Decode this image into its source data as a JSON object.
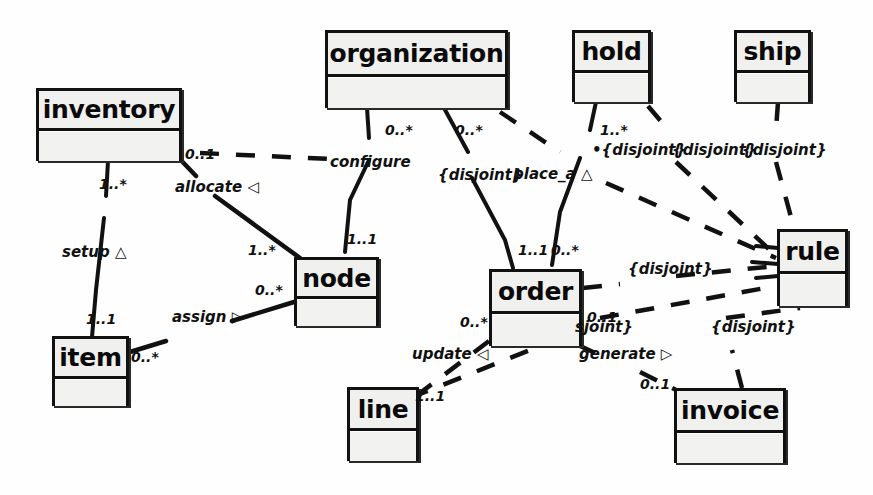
{
  "diagram": {
    "background_color": "#fefefe",
    "line_color": "#111111",
    "box_fill_color": "#f2f2f0"
  },
  "classes": [
    {
      "id": "inventory",
      "name": "inventory",
      "x": 36,
      "y": 88,
      "w": 146,
      "h": 73,
      "font_size": 25
    },
    {
      "id": "organization",
      "name": "organization",
      "x": 325,
      "y": 30,
      "w": 183,
      "h": 78,
      "font_size": 25
    },
    {
      "id": "hold",
      "name": "hold",
      "x": 572,
      "y": 30,
      "w": 79,
      "h": 72,
      "font_size": 25
    },
    {
      "id": "ship",
      "name": "ship",
      "x": 734,
      "y": 30,
      "w": 77,
      "h": 72,
      "font_size": 25
    },
    {
      "id": "node",
      "name": "node",
      "x": 294,
      "y": 257,
      "w": 85,
      "h": 69,
      "font_size": 25
    },
    {
      "id": "order",
      "name": "order",
      "x": 489,
      "y": 269,
      "w": 93,
      "h": 77,
      "font_size": 25
    },
    {
      "id": "rule",
      "name": "rule",
      "x": 777,
      "y": 229,
      "w": 71,
      "h": 77,
      "font_size": 25
    },
    {
      "id": "item",
      "name": "item",
      "x": 52,
      "y": 336,
      "w": 77,
      "h": 70,
      "font_size": 25
    },
    {
      "id": "line",
      "name": "line",
      "x": 347,
      "y": 387,
      "w": 72,
      "h": 74,
      "font_size": 25
    },
    {
      "id": "invoice",
      "name": "invoice",
      "x": 674,
      "y": 388,
      "w": 112,
      "h": 75,
      "font_size": 25
    }
  ],
  "labels": {
    "multiplicities": [
      {
        "id": "m-inv-alloc",
        "text": "0..1",
        "x": 185,
        "y": 147
      },
      {
        "id": "m-inv-setup",
        "text": "1..*",
        "x": 99,
        "y": 177
      },
      {
        "id": "m-item-setup",
        "text": "1..1",
        "x": 86,
        "y": 312
      },
      {
        "id": "m-item-assign",
        "text": "0..*",
        "x": 131,
        "y": 350
      },
      {
        "id": "m-node-alloc",
        "text": "1..*",
        "x": 248,
        "y": 243
      },
      {
        "id": "m-node-assign",
        "text": "0..*",
        "x": 255,
        "y": 283
      },
      {
        "id": "m-node-conf",
        "text": "1..1",
        "x": 347,
        "y": 232
      },
      {
        "id": "m-org-conf",
        "text": "0..*",
        "x": 385,
        "y": 123
      },
      {
        "id": "m-org-place",
        "text": "0..*",
        "x": 455,
        "y": 123
      },
      {
        "id": "m-hold-place",
        "text": "1..*",
        "x": 600,
        "y": 123
      },
      {
        "id": "m-order-place",
        "text": "1..1",
        "x": 518,
        "y": 243
      },
      {
        "id": "m-order-rule",
        "text": "0..*",
        "x": 551,
        "y": 243
      },
      {
        "id": "m-order-upd",
        "text": "0..*",
        "x": 460,
        "y": 315
      },
      {
        "id": "m-order-gen",
        "text": "0..1",
        "x": 587,
        "y": 310
      },
      {
        "id": "m-line-upd",
        "text": "1..1",
        "x": 415,
        "y": 389
      },
      {
        "id": "m-invoice-gen",
        "text": "0..1",
        "x": 640,
        "y": 377
      }
    ],
    "roles": [
      {
        "id": "r-configure",
        "text": "configure",
        "x": 330,
        "y": 155
      },
      {
        "id": "r-allocate",
        "text": "allocate ◁",
        "x": 175,
        "y": 180
      },
      {
        "id": "r-setup",
        "text": "setup △",
        "x": 62,
        "y": 245
      },
      {
        "id": "r-assign",
        "text": "assign ▷",
        "x": 172,
        "y": 310
      },
      {
        "id": "r-place_a",
        "text": "place_a △",
        "x": 513,
        "y": 167
      },
      {
        "id": "r-update",
        "text": "update ◁",
        "x": 412,
        "y": 347
      },
      {
        "id": "r-generate",
        "text": "generate ▷",
        "x": 579,
        "y": 347
      }
    ],
    "constraints": [
      {
        "id": "c-org-node",
        "text": "{disjoint}",
        "x": 438,
        "y": 168
      },
      {
        "id": "c-org-rule",
        "text": "•{disjoint}",
        "x": 592,
        "y": 143
      },
      {
        "id": "c-hold-rule",
        "text": "{disjoint}",
        "x": 672,
        "y": 143
      },
      {
        "id": "c-ship-rule",
        "text": "{disjoint}",
        "x": 742,
        "y": 143
      },
      {
        "id": "c-order-rule",
        "text": "{disjoint}",
        "x": 628,
        "y": 262
      },
      {
        "id": "c-line-rule",
        "text": "sjoint}",
        "x": 575,
        "y": 320
      },
      {
        "id": "c-invoice-rule",
        "text": "{disjoint}",
        "x": 711,
        "y": 320
      }
    ]
  },
  "edges": [
    {
      "id": "e-inventory-item-setup",
      "kind": "solid",
      "from": "inventory",
      "to": "item"
    },
    {
      "id": "e-inventory-node-allocate",
      "kind": "solid",
      "from": "inventory",
      "to": "node"
    },
    {
      "id": "e-item-node-assign",
      "kind": "solid",
      "from": "item",
      "to": "node"
    },
    {
      "id": "e-organization-node-configure",
      "kind": "dashed",
      "from": "organization",
      "to": "node"
    },
    {
      "id": "e-organization-inventory-configure",
      "kind": "dashed",
      "from": "inventory",
      "to": "organization"
    },
    {
      "id": "e-organization-order-place",
      "kind": "solid",
      "from": "organization",
      "to": "order"
    },
    {
      "id": "e-organization-rule",
      "kind": "dashed",
      "from": "organization",
      "to": "rule"
    },
    {
      "id": "e-hold-order-place",
      "kind": "solid",
      "from": "hold",
      "to": "order"
    },
    {
      "id": "e-hold-rule",
      "kind": "dashed",
      "from": "hold",
      "to": "rule"
    },
    {
      "id": "e-ship-rule",
      "kind": "dashed",
      "from": "ship",
      "to": "rule"
    },
    {
      "id": "e-order-rule",
      "kind": "dashed",
      "from": "order",
      "to": "rule"
    },
    {
      "id": "e-order-line-update",
      "kind": "dashed",
      "from": "order",
      "to": "line"
    },
    {
      "id": "e-order-invoice-generate",
      "kind": "dashed",
      "from": "order",
      "to": "invoice"
    },
    {
      "id": "e-line-rule",
      "kind": "dashed",
      "from": "line",
      "to": "rule"
    },
    {
      "id": "e-invoice-rule",
      "kind": "dashed",
      "from": "invoice",
      "to": "rule"
    }
  ]
}
